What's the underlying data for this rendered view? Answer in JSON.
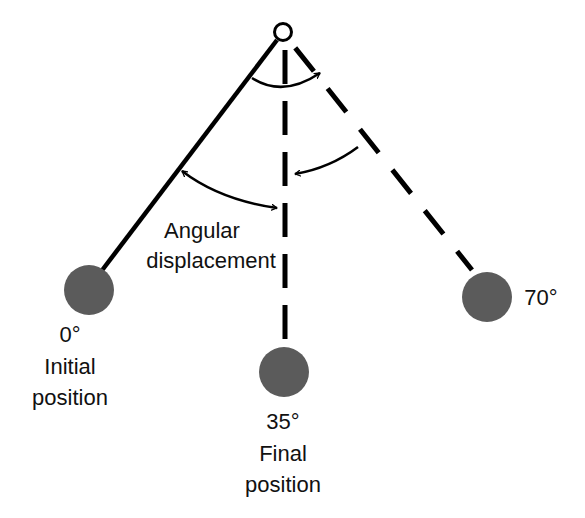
{
  "diagram": {
    "colors": {
      "background": "#ffffff",
      "line": "#000000",
      "bob": "#5b5b5b",
      "text": "#111111"
    },
    "pivot": {
      "x": 283,
      "y": 32,
      "r": 9
    },
    "positions": [
      {
        "id": "initial",
        "angle_label": "0°",
        "line1": "Initial",
        "line2": "position",
        "bob": {
          "x": 89,
          "y": 290,
          "r": 25
        },
        "line_style": "solid"
      },
      {
        "id": "final",
        "angle_label": "35°",
        "line1": "Final",
        "line2": "position",
        "bob": {
          "x": 284,
          "y": 372,
          "r": 25
        },
        "line_style": "dashed"
      },
      {
        "id": "extreme",
        "angle_label": "70°",
        "bob": {
          "x": 487,
          "y": 297,
          "r": 25
        },
        "line_style": "dashed"
      }
    ],
    "annotation": {
      "line1": "Angular",
      "line2": "displacement"
    }
  }
}
